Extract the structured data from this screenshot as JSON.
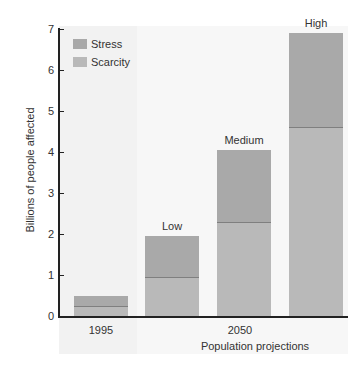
{
  "colors": {
    "stress": "#a9a9a9",
    "scarcity": "#b9b9b9",
    "divider": "#7f7f7f",
    "band_1995": "#f1f1f1",
    "band_2050": "#f6f6f6"
  },
  "legend": {
    "items": [
      {
        "label": "Stress",
        "series": "stress"
      },
      {
        "label": "Scarcity",
        "series": "scarcity"
      }
    ]
  },
  "axis": {
    "y_title": "Billions of people affected",
    "y_ticks": [
      "0",
      "1",
      "2",
      "3",
      "4",
      "5",
      "6",
      "7"
    ],
    "x_group_labels": [
      "1995",
      "2050"
    ],
    "x_title": "Population projections"
  },
  "bars": [
    {
      "group": "1995",
      "label": "",
      "total": 0.5,
      "scarcity": 0.25,
      "stress": 0.25
    },
    {
      "group": "2050",
      "label": "Low",
      "total": 1.95,
      "scarcity": 0.95,
      "stress": 1.0
    },
    {
      "group": "2050",
      "label": "Medium",
      "total": 4.05,
      "scarcity": 2.3,
      "stress": 1.75
    },
    {
      "group": "2050",
      "label": "High",
      "total": 6.9,
      "scarcity": 4.6,
      "stress": 2.3
    }
  ],
  "chart_data": {
    "type": "bar",
    "stacked": true,
    "title": "",
    "categories": [
      "1995",
      "2050 Low",
      "2050 Medium",
      "2050 High"
    ],
    "series": [
      {
        "name": "Scarcity",
        "values": [
          0.25,
          0.95,
          2.3,
          4.6
        ]
      },
      {
        "name": "Stress",
        "values": [
          0.25,
          1.0,
          1.75,
          2.3
        ]
      }
    ],
    "totals": [
      0.5,
      1.95,
      4.05,
      6.9
    ],
    "bar_annotations": [
      "",
      "Low",
      "Medium",
      "High"
    ],
    "xlabel": "Population projections",
    "x_group_labels": [
      "1995",
      "2050"
    ],
    "ylabel": "Billions of people affected",
    "ylim": [
      0,
      7
    ],
    "yticks": [
      0,
      1,
      2,
      3,
      4,
      5,
      6,
      7
    ],
    "grid": false,
    "legend_position": "upper left"
  }
}
